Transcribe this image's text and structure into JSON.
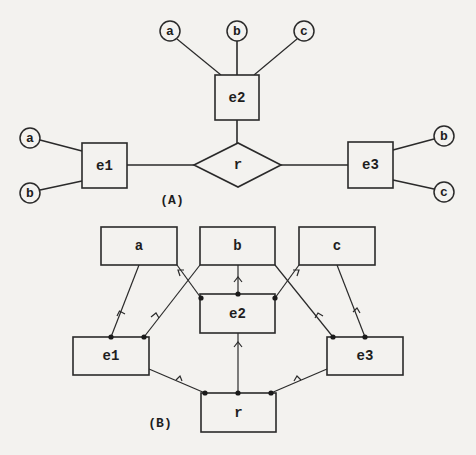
{
  "diagram_a": {
    "caption": "(A)",
    "attributes": [
      {
        "id": "a_top",
        "label": "a"
      },
      {
        "id": "b_top",
        "label": "b"
      },
      {
        "id": "c_top",
        "label": "c"
      },
      {
        "id": "a_left",
        "label": "a"
      },
      {
        "id": "b_left",
        "label": "b"
      },
      {
        "id": "b_right",
        "label": "b"
      },
      {
        "id": "c_right",
        "label": "c"
      }
    ],
    "entities": [
      {
        "id": "e1",
        "label": "e1"
      },
      {
        "id": "e2",
        "label": "e2"
      },
      {
        "id": "e3",
        "label": "e3"
      }
    ],
    "relationship": {
      "id": "r",
      "label": "r"
    }
  },
  "diagram_b": {
    "caption": "(B)",
    "nodes": [
      {
        "id": "a",
        "label": "a"
      },
      {
        "id": "b",
        "label": "b"
      },
      {
        "id": "c",
        "label": "c"
      },
      {
        "id": "e1",
        "label": "e1"
      },
      {
        "id": "e2",
        "label": "e2"
      },
      {
        "id": "e3",
        "label": "e3"
      },
      {
        "id": "r",
        "label": "r"
      }
    ],
    "edges": [
      {
        "from": "e1",
        "to": "a"
      },
      {
        "from": "e1",
        "to": "b"
      },
      {
        "from": "e2",
        "to": "a"
      },
      {
        "from": "e2",
        "to": "b"
      },
      {
        "from": "e2",
        "to": "c"
      },
      {
        "from": "e3",
        "to": "b"
      },
      {
        "from": "e3",
        "to": "c"
      },
      {
        "from": "r",
        "to": "e1"
      },
      {
        "from": "r",
        "to": "e2"
      },
      {
        "from": "r",
        "to": "e3"
      }
    ]
  }
}
